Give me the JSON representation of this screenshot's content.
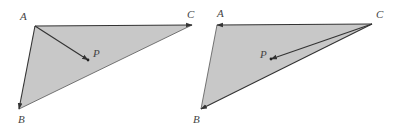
{
  "diagrams": [
    {
      "name": "left-triangle",
      "fill_color": "#c8c8c8",
      "vertices": {
        "A": {
          "label": "A",
          "x": 35,
          "y": 26,
          "lx": 20,
          "ly": 20
        },
        "B": {
          "label": "B",
          "x": 19,
          "y": 109,
          "lx": 18,
          "ly": 123
        },
        "C": {
          "label": "C",
          "x": 192,
          "y": 25,
          "lx": 187,
          "ly": 18
        },
        "P": {
          "label": "P",
          "x": 88,
          "y": 60,
          "lx": 93,
          "ly": 57
        }
      },
      "vectors": [
        "AC",
        "AB",
        "AP"
      ],
      "plain_edges": [
        "BC"
      ]
    },
    {
      "name": "right-triangle",
      "fill_color": "#c8c8c8",
      "vertices": {
        "A": {
          "label": "A",
          "x": 217,
          "y": 25,
          "lx": 217,
          "ly": 17
        },
        "B": {
          "label": "B",
          "x": 201,
          "y": 109,
          "lx": 193,
          "ly": 123
        },
        "C": {
          "label": "C",
          "x": 372,
          "y": 24,
          "lx": 376,
          "ly": 18
        },
        "P": {
          "label": "P",
          "x": 271,
          "y": 59,
          "lx": 260,
          "ly": 58
        }
      },
      "vectors": [
        "CA",
        "CB",
        "CP"
      ],
      "plain_edges": [
        "AB"
      ]
    }
  ]
}
